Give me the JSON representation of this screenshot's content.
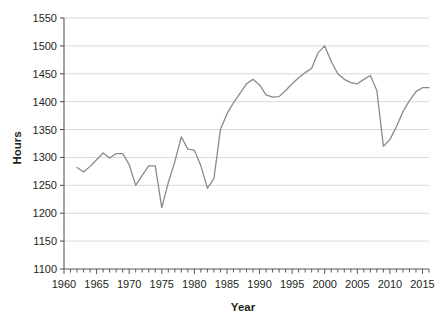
{
  "chart_data": {
    "type": "line",
    "title": "",
    "xlabel": "Year",
    "ylabel": "Hours",
    "xlim": [
      1960,
      2016
    ],
    "ylim": [
      1100,
      1550
    ],
    "ytick_step": 50,
    "xtick_step": 1,
    "xlabel_step": 5,
    "grid": true,
    "grid_axis": "y",
    "legend": false,
    "line_color": "#8a8a8a",
    "series": [
      {
        "name": "Hours",
        "x": [
          1962,
          1963,
          1964,
          1965,
          1966,
          1967,
          1968,
          1969,
          1970,
          1971,
          1972,
          1973,
          1974,
          1975,
          1976,
          1977,
          1978,
          1979,
          1980,
          1981,
          1982,
          1983,
          1984,
          1985,
          1986,
          1987,
          1988,
          1989,
          1990,
          1991,
          1992,
          1993,
          1994,
          1995,
          1996,
          1997,
          1998,
          1999,
          2000,
          2001,
          2002,
          2003,
          2004,
          2005,
          2006,
          2007,
          2008,
          2009,
          2010,
          2011,
          2012,
          2013,
          2014,
          2015,
          2016
        ],
        "values": [
          1282,
          1274,
          1284,
          1296,
          1308,
          1299,
          1307,
          1307,
          1287,
          1250,
          1268,
          1285,
          1285,
          1210,
          1255,
          1292,
          1337,
          1315,
          1313,
          1285,
          1245,
          1262,
          1350,
          1378,
          1398,
          1415,
          1432,
          1440,
          1430,
          1412,
          1408,
          1409,
          1420,
          1432,
          1443,
          1452,
          1460,
          1488,
          1500,
          1472,
          1450,
          1440,
          1434,
          1432,
          1440,
          1447,
          1420,
          1320,
          1332,
          1355,
          1382,
          1402,
          1418,
          1425,
          1425
        ]
      }
    ],
    "ytick_labels": [
      "1100",
      "1150",
      "1200",
      "1250",
      "1300",
      "1350",
      "1400",
      "1450",
      "1500",
      "1550"
    ],
    "xtick_labels": [
      "1960",
      "1965",
      "1970",
      "1975",
      "1980",
      "1985",
      "1990",
      "1995",
      "2000",
      "2005",
      "2010",
      "2015"
    ]
  },
  "colors": {
    "line": "#8a8a8a",
    "grid": "#d9d9d9",
    "axis": "#58595b",
    "text": "#231f20",
    "background": "#ffffff"
  }
}
